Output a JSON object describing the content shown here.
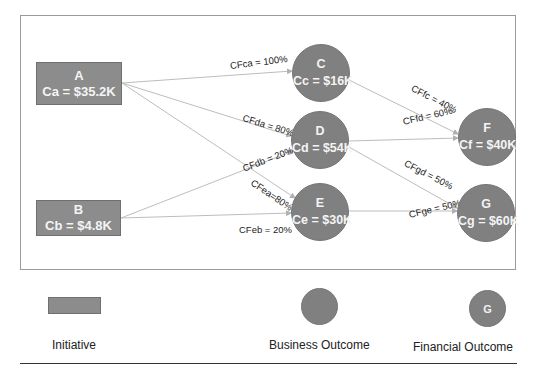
{
  "diagram": {
    "initiatives": [
      {
        "id": "A",
        "name": "A",
        "cost_label": "Ca = $35.2K"
      },
      {
        "id": "B",
        "name": "B",
        "cost_label": "Cb = $4.8K"
      }
    ],
    "business_outcomes": [
      {
        "id": "C",
        "name": "C",
        "cost_label": "Cc = $16K"
      },
      {
        "id": "D",
        "name": "D",
        "cost_label": "Cd = $54K"
      },
      {
        "id": "E",
        "name": "E",
        "cost_label": "Ce = $30K"
      }
    ],
    "financial_outcomes": [
      {
        "id": "F",
        "name": "F",
        "cost_label": "Cf = $40K"
      },
      {
        "id": "G",
        "name": "G",
        "cost_label": "Cg = $60K"
      }
    ],
    "edges": [
      {
        "from": "A",
        "to": "C",
        "label": "CFca = 100%"
      },
      {
        "from": "A",
        "to": "D",
        "label": "CFda = 80%"
      },
      {
        "from": "B",
        "to": "D",
        "label": "CFdb = 20%"
      },
      {
        "from": "A",
        "to": "E",
        "label": "CFea=80%"
      },
      {
        "from": "B",
        "to": "E",
        "label": "CFeb = 20%"
      },
      {
        "from": "C",
        "to": "F",
        "label": "CFfc = 40%"
      },
      {
        "from": "D",
        "to": "F",
        "label": "CFfd = 60%"
      },
      {
        "from": "D",
        "to": "G",
        "label": "CFgd = 50%"
      },
      {
        "from": "E",
        "to": "G",
        "label": "CFge = 50%"
      }
    ]
  },
  "legend": {
    "initiative_label": "Initiative",
    "business_outcome_label": "Business Outcome",
    "financial_outcome_label": "Financial Outcome",
    "financial_outcome_glyph": "G"
  },
  "colors": {
    "node_fill": "#808080",
    "initiative_fill": "#8c8c8c",
    "edge_line": "#b8b8b8",
    "frame_border": "#9a9a9a",
    "node_text": "#f4f4f4"
  }
}
